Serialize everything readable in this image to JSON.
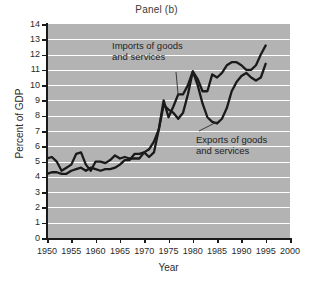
{
  "chart_data": {
    "type": "line",
    "title": "Panel (b)",
    "xlabel": "Year",
    "ylabel": "Percent of GDP",
    "xlim": [
      1950,
      2000
    ],
    "ylim": [
      0,
      14
    ],
    "grid": true,
    "legend_position": "inline-annotations",
    "xticks": [
      1950,
      1955,
      1960,
      1965,
      1970,
      1975,
      1980,
      1985,
      1990,
      1995,
      2000
    ],
    "yticks": [
      0,
      1,
      2,
      3,
      4,
      5,
      6,
      7,
      8,
      9,
      10,
      11,
      12,
      13,
      14
    ],
    "x": [
      1950,
      1951,
      1952,
      1953,
      1954,
      1955,
      1956,
      1957,
      1958,
      1959,
      1960,
      1961,
      1962,
      1963,
      1964,
      1965,
      1966,
      1967,
      1968,
      1969,
      1970,
      1971,
      1972,
      1973,
      1974,
      1975,
      1976,
      1977,
      1978,
      1979,
      1980,
      1981,
      1982,
      1983,
      1984,
      1985,
      1986,
      1987,
      1988,
      1989,
      1990,
      1991,
      1992,
      1993,
      1994,
      1995
    ],
    "series": [
      {
        "name": "Imports of goods and services",
        "values": [
          4.2,
          4.3,
          4.3,
          4.2,
          4.2,
          4.4,
          4.5,
          4.6,
          4.4,
          4.6,
          4.5,
          4.4,
          4.5,
          4.5,
          4.6,
          4.8,
          5.1,
          5.1,
          5.5,
          5.5,
          5.6,
          5.8,
          6.3,
          7.1,
          9.0,
          7.9,
          8.6,
          9.4,
          9.4,
          10.0,
          10.9,
          10.4,
          9.6,
          9.6,
          10.7,
          10.5,
          10.8,
          11.3,
          11.5,
          11.5,
          11.3,
          11.0,
          11.0,
          11.3,
          12.0,
          12.6
        ]
      },
      {
        "name": "Exports of goods and services",
        "values": [
          5.2,
          5.3,
          5.0,
          4.4,
          4.6,
          4.8,
          5.5,
          5.6,
          4.8,
          4.4,
          5.0,
          5.0,
          4.9,
          5.1,
          5.4,
          5.2,
          5.3,
          5.2,
          5.2,
          5.2,
          5.6,
          5.3,
          5.6,
          7.1,
          8.7,
          8.4,
          8.2,
          7.8,
          8.2,
          9.4,
          10.9,
          10.0,
          8.8,
          7.9,
          7.6,
          7.5,
          7.8,
          8.5,
          9.6,
          10.2,
          10.6,
          10.8,
          10.5,
          10.3,
          10.5,
          11.4
        ]
      }
    ],
    "annotations": [
      {
        "text": "Imports of goods\nand services",
        "target_year": 1977,
        "target_value": 9.3
      },
      {
        "text": "Exports of goods\nand services",
        "target_year": 1985,
        "target_value": 7.6
      }
    ],
    "colors": {
      "plot_background": "#b3b3b3",
      "gridline": "#ffffff",
      "series_line": "#1a1a1a",
      "axis": "#1a1a1a",
      "page_background": "#ffffff"
    }
  }
}
